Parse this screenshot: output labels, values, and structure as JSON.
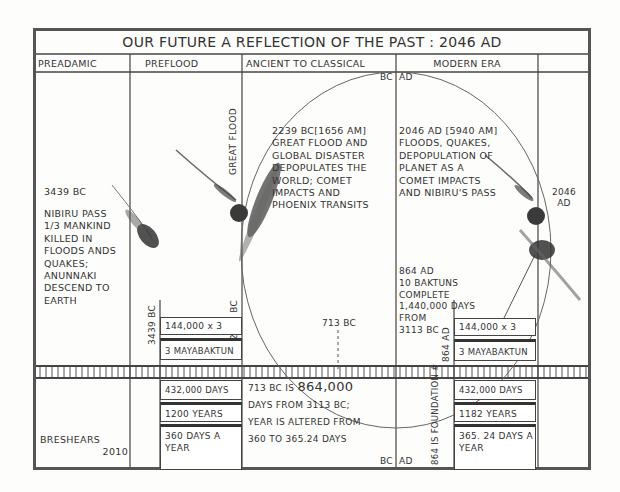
{
  "title": "OUR FUTURE A REFLECTION OF THE PAST : 2046 AD",
  "columns": [
    {
      "id": "preadamic",
      "label": "PREADAMIC"
    },
    {
      "id": "preflood",
      "label": "PREFLOOD"
    },
    {
      "id": "ancient",
      "label": "ANCIENT TO CLASSICAL"
    },
    {
      "id": "modern",
      "label": "MODERN ERA"
    },
    {
      "id": "extra",
      "label": ""
    }
  ],
  "markers": {
    "bc_top": "BC",
    "ad_top": "AD",
    "bc_bottom": "BC",
    "ad_bottom": "AD",
    "great_flood": "GREAT FLOOD",
    "v_3439": "3439 BC",
    "v_2239": "2239 BC",
    "v_864": "864 AD",
    "year_713": "713 BC",
    "year_2046": "2046 AD",
    "foundation": "864 IS FOUNDATION #"
  },
  "notes": {
    "preadamic": {
      "year": "3439 BC",
      "lines": [
        "NIBIRU PASS",
        "1/3 MANKIND",
        "KILLED IN",
        "FLOODS ANDS",
        "QUAKES;",
        "ANUNNAKI",
        "DESCEND TO",
        "EARTH"
      ]
    },
    "ancient": {
      "lines": [
        "2239 BC[1656 AM]",
        "GREAT FLOOD AND",
        "GLOBAL DISASTER",
        "DEPOPULATES THE",
        "WORLD; COMET",
        "IMPACTS AND",
        "PHOENIX TRANSITS"
      ]
    },
    "modern": {
      "lines": [
        "2046 AD [5940 AM]",
        "FLOODS, QUAKES,",
        "DEPOPULATION  OF",
        "PLANET AS A",
        "COMET IMPACTS",
        "AND NIBIRU'S PASS"
      ]
    },
    "baktuns": {
      "lines": [
        "864 AD",
        "10 BAKTUNS",
        "COMPLETE",
        "1,440,000 DAYS",
        "FROM",
        "3113 BC"
      ]
    },
    "year713": {
      "line1_prefix": "713 BC IS",
      "line1_big": "864,000",
      "lines": [
        "DAYS FROM 3113 BC;",
        "YEAR IS ALTERED FROM",
        "360 TO 365.24 DAYS"
      ]
    }
  },
  "boxes": {
    "left_upper": [
      "144,000 x 3",
      "3 MAYABAKTUN"
    ],
    "left_lower": [
      "432,000 DAYS",
      "1200 YEARS",
      "360 DAYS A YEAR"
    ],
    "right_upper": [
      "144,000 x 3",
      "3 MAYABAKTUN"
    ],
    "right_lower": [
      "432,000 DAYS",
      "1182 YEARS",
      "365. 24 DAYS A YEAR"
    ]
  },
  "signature": {
    "name": "BRESHEARS",
    "year": "2010"
  },
  "colors": {
    "ink": "#333333",
    "paper": "#fdfdfb",
    "frame": "#555555"
  }
}
